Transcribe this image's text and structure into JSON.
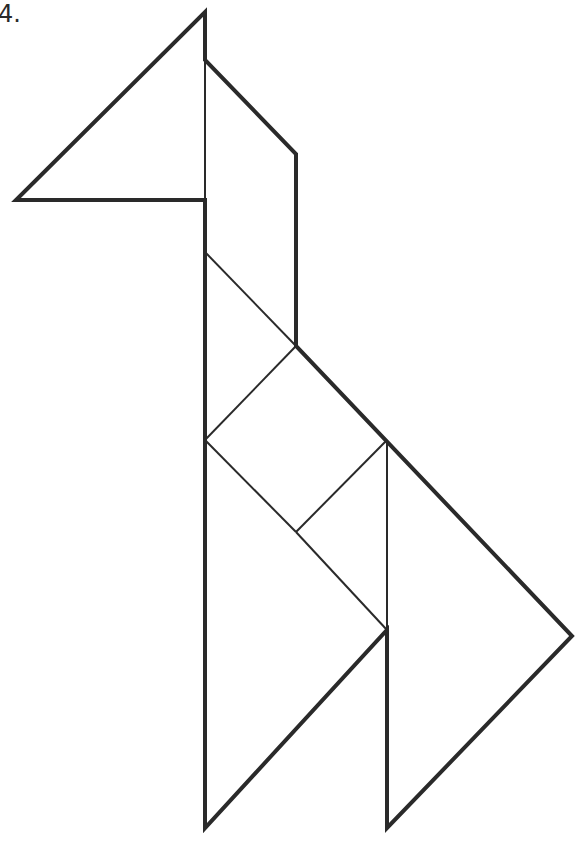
{
  "puzzle": {
    "number_label": "4.",
    "subject": "tangram giraffe"
  },
  "style": {
    "stroke_color": "#2a2a2a",
    "background": "#ffffff",
    "outline_width": 4,
    "inner_width": 2
  },
  "pieces": [
    {
      "name": "large-triangle-head",
      "points": "205,12 16,200 205,200"
    },
    {
      "name": "parallelogram-neck",
      "points": "205,60 296,154 296,346 205,252"
    },
    {
      "name": "small-triangle-upper",
      "points": "205,252 296,346 205,440"
    },
    {
      "name": "square-body",
      "points": "296,346 387,440 296,532 205,440"
    },
    {
      "name": "small-triangle-lower",
      "points": "387,440 387,630 296,532"
    },
    {
      "name": "large-triangle-left-leg",
      "points": "205,440 387,630 205,828"
    },
    {
      "name": "medium-triangle-right-leg",
      "points": "387,440 572,636 387,828"
    }
  ]
}
